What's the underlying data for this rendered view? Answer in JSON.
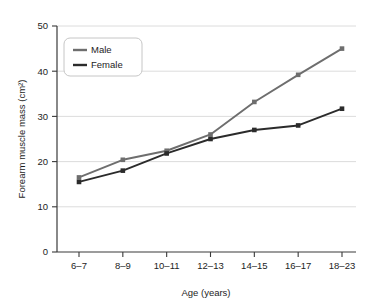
{
  "chart_data": {
    "type": "line",
    "title": "",
    "xlabel": "Age (years)",
    "ylabel": "Forearm muscle mass (cm²)",
    "categories": [
      "6–7",
      "8–9",
      "10–11",
      "12–13",
      "14–15",
      "16–17",
      "18–23"
    ],
    "yticks": [
      "0",
      "10",
      "20",
      "30",
      "40",
      "50"
    ],
    "ytick_values": [
      0,
      10,
      20,
      30,
      40,
      50
    ],
    "ylim": [
      0,
      50
    ],
    "grid": "horizontal",
    "legend_position": "top-left-inside",
    "series": [
      {
        "name": "Male",
        "color": "#6e6e6e",
        "marker": "square",
        "values": [
          16.5,
          20.4,
          22.4,
          26.0,
          33.2,
          39.2,
          45.0
        ]
      },
      {
        "name": "Female",
        "color": "#2b2b2b",
        "marker": "square",
        "values": [
          15.5,
          18.0,
          21.8,
          25.0,
          27.0,
          28.0,
          31.7
        ]
      }
    ]
  },
  "legend": {
    "items": [
      {
        "label": "Male"
      },
      {
        "label": "Female"
      }
    ]
  },
  "colors": {
    "male": "#6e6e6e",
    "female": "#2b2b2b",
    "axis": "#3a3a3a",
    "grid": "#d8d8d8",
    "background": "#ffffff"
  }
}
